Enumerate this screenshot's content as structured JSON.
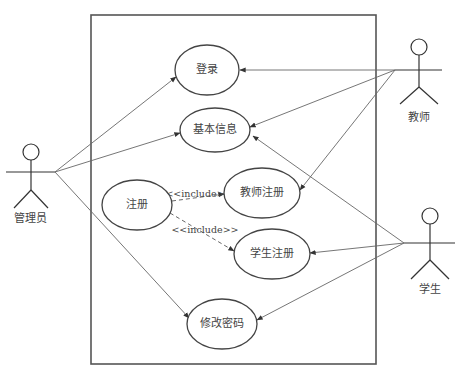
{
  "diagram": {
    "type": "use-case",
    "system_boundary": {
      "label": ""
    },
    "actors": [
      {
        "id": "admin",
        "label": "管理员"
      },
      {
        "id": "teacher",
        "label": "教师"
      },
      {
        "id": "student",
        "label": "学生"
      }
    ],
    "use_cases": [
      {
        "id": "login",
        "label": "登录"
      },
      {
        "id": "basic_info",
        "label": "基本信息"
      },
      {
        "id": "register",
        "label": "注册"
      },
      {
        "id": "teacher_register",
        "label": "教师注册"
      },
      {
        "id": "student_register",
        "label": "学生注册"
      },
      {
        "id": "change_password",
        "label": "修改密码"
      }
    ],
    "associations": [
      {
        "from": "admin",
        "to": "login"
      },
      {
        "from": "admin",
        "to": "basic_info"
      },
      {
        "from": "admin",
        "to": "change_password"
      },
      {
        "from": "teacher",
        "to": "login"
      },
      {
        "from": "teacher",
        "to": "basic_info"
      },
      {
        "from": "teacher",
        "to": "teacher_register"
      },
      {
        "from": "student",
        "to": "basic_info"
      },
      {
        "from": "student",
        "to": "student_register"
      },
      {
        "from": "student",
        "to": "change_password"
      }
    ],
    "includes": [
      {
        "from": "register",
        "to": "teacher_register",
        "label": "<<include>>"
      },
      {
        "from": "register",
        "to": "student_register",
        "label": "<<include>>"
      }
    ]
  }
}
